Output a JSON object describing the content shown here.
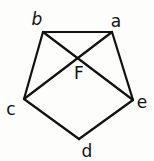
{
  "diagram": {
    "type": "pentagon-with-diagonals",
    "vertices": [
      {
        "id": "a",
        "label": "a"
      },
      {
        "id": "b",
        "label": "b"
      },
      {
        "id": "c",
        "label": "c"
      },
      {
        "id": "d",
        "label": "d"
      },
      {
        "id": "e",
        "label": "e"
      }
    ],
    "edges": [
      {
        "from": "a",
        "to": "b",
        "kind": "side"
      },
      {
        "from": "b",
        "to": "c",
        "kind": "side"
      },
      {
        "from": "c",
        "to": "d",
        "kind": "side"
      },
      {
        "from": "d",
        "to": "e",
        "kind": "side"
      },
      {
        "from": "e",
        "to": "a",
        "kind": "side"
      },
      {
        "from": "b",
        "to": "e",
        "kind": "diagonal"
      },
      {
        "from": "a",
        "to": "c",
        "kind": "diagonal"
      }
    ],
    "intersection": {
      "id": "F",
      "label": "F",
      "of": [
        "be",
        "ac"
      ]
    }
  }
}
